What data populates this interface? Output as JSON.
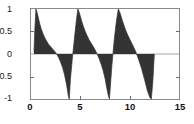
{
  "chart_data": {
    "type": "area",
    "title": "",
    "xlabel": "",
    "ylabel": "",
    "xlim": [
      0,
      15
    ],
    "ylim": [
      -1,
      1
    ],
    "grid": false,
    "legend": null,
    "fill_color": "#333333",
    "line_color": "#333333",
    "axis_color": "#8a8a8a",
    "background": "#ffffff",
    "xticks": [
      0,
      5,
      10,
      15
    ],
    "xticklabels": [
      "0",
      "5",
      "10",
      "15"
    ],
    "yticks": [
      -1,
      -0.5,
      0,
      0.5,
      1
    ],
    "yticklabels": [
      "-1",
      "-0.5",
      "0",
      "0.5",
      "1"
    ],
    "period": 4.05,
    "signal_start": 0.3,
    "signal_end": 12.5,
    "positive_peaks": [
      {
        "x": 0.5,
        "y": 1
      },
      {
        "x": 4.75,
        "y": 1
      },
      {
        "x": 8.85,
        "y": 1
      }
    ],
    "negative_peaks": [
      {
        "x": 3.8,
        "y": -1
      },
      {
        "x": 7.9,
        "y": -1
      },
      {
        "x": 12.2,
        "y": -1
      }
    ],
    "zero_crossings": [
      2.4,
      3.85,
      6.5,
      7.95,
      10.6,
      12.3
    ],
    "envelope_decay_rate": 1.55,
    "series": [
      {
        "name": "signal",
        "x": [
          0.3,
          0.4,
          0.5,
          0.62,
          0.75,
          0.9,
          1.05,
          1.2,
          1.4,
          1.6,
          1.8,
          2.0,
          2.2,
          2.4,
          2.6,
          2.8,
          3.0,
          3.2,
          3.4,
          3.6,
          3.72,
          3.8,
          3.88,
          4.0,
          4.2,
          4.45,
          4.6,
          4.75,
          4.88,
          5.0,
          5.15,
          5.3,
          5.5,
          5.7,
          5.9,
          6.1,
          6.3,
          6.5,
          6.7,
          6.9,
          7.1,
          7.3,
          7.5,
          7.7,
          7.85,
          7.95,
          8.05,
          8.2,
          8.45,
          8.65,
          8.85,
          8.98,
          9.1,
          9.25,
          9.45,
          9.65,
          9.85,
          10.05,
          10.3,
          10.6,
          10.9,
          11.2,
          11.5,
          11.8,
          12.05,
          12.2,
          12.35,
          12.5
        ],
        "y": [
          0.05,
          0.6,
          1.0,
          0.92,
          0.8,
          0.66,
          0.55,
          0.46,
          0.36,
          0.28,
          0.21,
          0.16,
          0.11,
          0.06,
          0.0,
          -0.08,
          -0.18,
          -0.3,
          -0.46,
          -0.68,
          -0.84,
          -0.95,
          -1.0,
          -0.55,
          -0.08,
          0.45,
          0.75,
          1.0,
          0.93,
          0.84,
          0.72,
          0.62,
          0.5,
          0.4,
          0.31,
          0.24,
          0.17,
          0.09,
          0.0,
          -0.1,
          -0.22,
          -0.36,
          -0.54,
          -0.78,
          -0.94,
          -1.0,
          -0.7,
          -0.25,
          0.35,
          0.72,
          1.0,
          0.94,
          0.86,
          0.75,
          0.62,
          0.5,
          0.4,
          0.31,
          0.2,
          0.06,
          -0.12,
          -0.32,
          -0.56,
          -0.82,
          -0.97,
          -1.0,
          -0.6,
          0.0
        ]
      }
    ]
  },
  "axes": {
    "y_labels": [
      "1",
      "0.5",
      "0",
      "-0.5",
      "-1"
    ],
    "x_labels": [
      "0",
      "5",
      "10",
      "15"
    ]
  }
}
